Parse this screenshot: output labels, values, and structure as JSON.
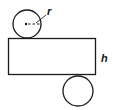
{
  "diagram": {
    "type": "cylinder-net",
    "labels": {
      "radius": "r",
      "height": "h"
    },
    "colors": {
      "stroke": "#1a1a1a",
      "background": "#ffffff"
    },
    "parts": [
      {
        "name": "top-circle",
        "shape": "circle"
      },
      {
        "name": "lateral-rectangle",
        "shape": "rectangle"
      },
      {
        "name": "bottom-circle",
        "shape": "circle"
      }
    ]
  }
}
